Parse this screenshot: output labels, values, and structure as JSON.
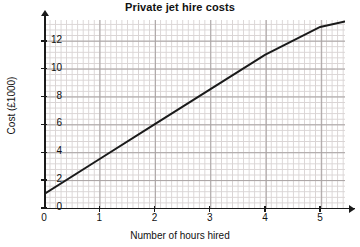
{
  "chart_data": {
    "type": "line",
    "title": "Private jet hire costs",
    "xlabel": "Number of hours hired",
    "ylabel": "Cost (£1000)",
    "xlim": [
      0,
      5.45
    ],
    "ylim": [
      0,
      13.5
    ],
    "xticks": [
      0,
      1,
      2,
      3,
      4,
      5
    ],
    "xtick_labels": [
      "0",
      "1",
      "2",
      "3",
      "4",
      "5"
    ],
    "yticks": [
      0,
      2,
      4,
      6,
      8,
      10,
      12
    ],
    "ytick_labels": [
      "0",
      "2",
      "4",
      "6",
      "8",
      "10",
      "12"
    ],
    "grid": true,
    "grid_minor": true,
    "legend": false,
    "series": [
      {
        "name": "Hire cost",
        "x": [
          0,
          1,
          2,
          3,
          4,
          5,
          5.45
        ],
        "values": [
          1.0,
          3.5,
          6.0,
          8.5,
          11.0,
          13.0,
          13.4
        ],
        "intercept": 1.0,
        "slope": 2.5,
        "color": "#1a1a1a"
      }
    ]
  },
  "axes": {
    "x_tick_positions_px": [
      44,
      99.4,
      154.9,
      210.3,
      265.8,
      321.2
    ],
    "y_tick_positions_px": [
      208,
      180.1,
      152.2,
      124.3,
      96.4,
      68.5,
      40.6
    ]
  },
  "colors": {
    "line": "#1a1a1a",
    "axis": "#1a1a1a",
    "grid_minor": "#d9d4d4",
    "grid_major": "#a8a2a2",
    "background": "#ffffff",
    "text": "#111111"
  }
}
